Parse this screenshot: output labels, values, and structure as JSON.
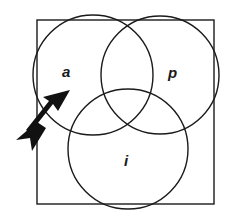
{
  "diagram": {
    "type": "venn",
    "sets": [
      {
        "id": "a",
        "label": "a"
      },
      {
        "id": "p",
        "label": "p"
      },
      {
        "id": "i",
        "label": "i"
      }
    ],
    "colors": {
      "stroke": "#1a1a1a",
      "background": "#ffffff"
    },
    "annotation": {
      "type": "arrow",
      "points_to": "a"
    }
  }
}
